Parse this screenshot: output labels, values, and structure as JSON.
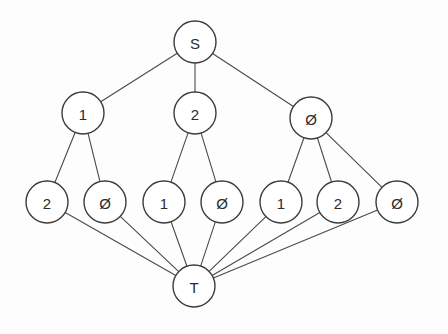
{
  "diagram": {
    "type": "node-link-tree",
    "background_color": "#fdfdfd",
    "node_fill_color": "#ffffff",
    "node_stroke_color": "#3c3c3c",
    "edge_color": "#4a4a4a",
    "label_color": "#2b2b2b",
    "node_radius": 21,
    "nodes": [
      {
        "id": "S",
        "label": "S",
        "x": 195,
        "y": 42,
        "level": 0,
        "role": "source"
      },
      {
        "id": "L1a",
        "label": "1",
        "x": 83,
        "y": 113,
        "level": 1,
        "role": "internal"
      },
      {
        "id": "L1b",
        "label": "2",
        "x": 195,
        "y": 113,
        "level": 1,
        "role": "internal"
      },
      {
        "id": "L1c",
        "label": "Ø",
        "x": 311,
        "y": 118,
        "level": 1,
        "role": "internal"
      },
      {
        "id": "L2a",
        "label": "2",
        "x": 47,
        "y": 202,
        "level": 2,
        "role": "internal"
      },
      {
        "id": "L2b",
        "label": "Ø",
        "x": 105,
        "y": 202,
        "level": 2,
        "role": "internal"
      },
      {
        "id": "L2c",
        "label": "1",
        "x": 164,
        "y": 202,
        "level": 2,
        "role": "internal"
      },
      {
        "id": "L2d",
        "label": "Ø",
        "x": 222,
        "y": 202,
        "level": 2,
        "role": "internal"
      },
      {
        "id": "L2e",
        "label": "1",
        "x": 281,
        "y": 202,
        "level": 2,
        "role": "internal"
      },
      {
        "id": "L2f",
        "label": "2",
        "x": 338,
        "y": 202,
        "level": 2,
        "role": "internal"
      },
      {
        "id": "L2g",
        "label": "Ø",
        "x": 397,
        "y": 202,
        "level": 2,
        "role": "internal"
      },
      {
        "id": "T",
        "label": "T",
        "x": 194,
        "y": 286,
        "level": 3,
        "role": "sink"
      }
    ],
    "edges": [
      {
        "from": "S",
        "to": "L1a"
      },
      {
        "from": "S",
        "to": "L1b"
      },
      {
        "from": "S",
        "to": "L1c"
      },
      {
        "from": "L1a",
        "to": "L2a"
      },
      {
        "from": "L1a",
        "to": "L2b"
      },
      {
        "from": "L1b",
        "to": "L2c"
      },
      {
        "from": "L1b",
        "to": "L2d"
      },
      {
        "from": "L1c",
        "to": "L2e"
      },
      {
        "from": "L1c",
        "to": "L2f"
      },
      {
        "from": "L1c",
        "to": "L2g"
      },
      {
        "from": "L2a",
        "to": "T"
      },
      {
        "from": "L2b",
        "to": "T"
      },
      {
        "from": "L2c",
        "to": "T"
      },
      {
        "from": "L2d",
        "to": "T"
      },
      {
        "from": "L2e",
        "to": "T"
      },
      {
        "from": "L2f",
        "to": "T"
      },
      {
        "from": "L2g",
        "to": "T"
      }
    ]
  }
}
